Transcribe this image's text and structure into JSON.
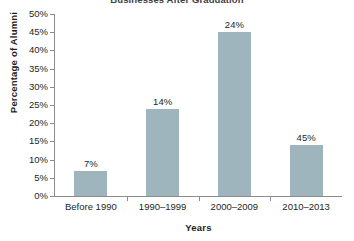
{
  "chart_data": {
    "type": "bar",
    "title": "Businesses After Graduation",
    "xlabel": "Years",
    "ylabel": "Percentage of Alumni",
    "categories": [
      "Before 1990",
      "1990–1999",
      "2000–2009",
      "2010–2013"
    ],
    "values": [
      7,
      24,
      45,
      14
    ],
    "value_labels": [
      "7%",
      "14%",
      "24%",
      "45%"
    ],
    "ylim": [
      0,
      50
    ],
    "ytick_step": 5,
    "ytick_labels": [
      "50%",
      "45%",
      "40%",
      "35%",
      "30%",
      "25%",
      "20%",
      "15%",
      "10%",
      "5%",
      "0%"
    ],
    "ytick_values": [
      50,
      45,
      40,
      35,
      30,
      25,
      20,
      15,
      10,
      5,
      0
    ],
    "grid": false,
    "legend": null,
    "bar_color": "#9fb5bd",
    "axis_color": "#8c8c8c",
    "text_color": "#231f20",
    "background_color": "#ffffff"
  }
}
